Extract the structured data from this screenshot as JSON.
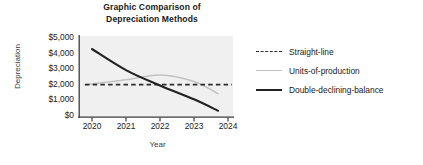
{
  "chart_data": {
    "type": "line",
    "title": "Graphic Comparison of Depreciation Methods",
    "title_line1": "Graphic Comparison of",
    "title_line2": "Depreciation Methods",
    "xlabel": "Year",
    "ylabel": "Depreciation",
    "categories": [
      "2020",
      "2021",
      "2022",
      "2023",
      "2024"
    ],
    "x": [
      2020,
      2021,
      2022,
      2023,
      2024
    ],
    "ylim": [
      0,
      5000
    ],
    "yticks": [
      0,
      1000,
      2000,
      3000,
      4000,
      5000
    ],
    "ytick_labels": [
      "$0",
      "$1,000",
      "$2,000",
      "$3,000",
      "$4,000",
      "$5,000"
    ],
    "grid": false,
    "legend_position": "right",
    "plot_background": "#f0f0f0",
    "series": [
      {
        "name": "Straight-line",
        "style": "dashed",
        "color": "#2b2b2b",
        "values": [
          2000,
          2000,
          2000,
          2000,
          2000
        ]
      },
      {
        "name": "Units-of-production",
        "style": "solid-light",
        "color": "#c2c2c2",
        "values": [
          2000,
          2300,
          2600,
          2200,
          1450
        ]
      },
      {
        "name": "Double-declining-balance",
        "style": "solid-bold",
        "color": "#222222",
        "values": [
          4200,
          2900,
          1950,
          1100,
          400
        ]
      }
    ]
  },
  "legend": {
    "items": [
      {
        "label": "Straight-line"
      },
      {
        "label": "Units-of-production"
      },
      {
        "label": "Double-declining-balance"
      }
    ]
  }
}
